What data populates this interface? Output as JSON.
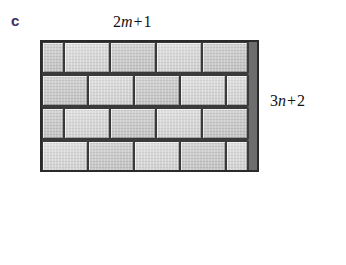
{
  "figure": {
    "part_label": "c",
    "part_label_color": "#3b2f63",
    "top_dimension": {
      "coefficient": "2",
      "variable": "m",
      "operator": "+",
      "constant": "1",
      "full_text": "2m + 1"
    },
    "right_dimension": {
      "coefficient": "3",
      "variable": "n",
      "operator": "+",
      "constant": "2",
      "full_text": "3n + 2"
    },
    "diagram": {
      "name": "brick-wall-rectangle",
      "pattern": "running-bond",
      "rows": 4,
      "bricks_per_row": "4.5",
      "border_color": "#2a2a2a",
      "brick_fill": "#d2d2d2",
      "mortar_color": "#3a3a3a",
      "brick_rows": [
        {
          "offset": "half-start",
          "bricks": [
            "half",
            "full",
            "full",
            "full",
            "full"
          ]
        },
        {
          "offset": "flush-start",
          "bricks": [
            "full",
            "full",
            "full",
            "full",
            "half"
          ]
        },
        {
          "offset": "half-start",
          "bricks": [
            "half",
            "full",
            "full",
            "full",
            "full"
          ]
        },
        {
          "offset": "flush-start",
          "bricks": [
            "full",
            "full",
            "full",
            "full",
            "half"
          ]
        }
      ]
    }
  }
}
